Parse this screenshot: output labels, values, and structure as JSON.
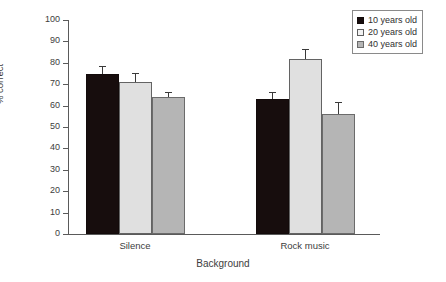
{
  "chart_data": {
    "type": "bar",
    "title": "",
    "subtitle": "",
    "xlabel": "Background",
    "ylabel": "% correct",
    "categories": [
      "Silence",
      "Rock music"
    ],
    "series": [
      {
        "name": "10 years old",
        "values": [
          75,
          63
        ],
        "errors": [
          3,
          3
        ],
        "color": "#170d0d"
      },
      {
        "name": "20 years old",
        "values": [
          71,
          82
        ],
        "errors": [
          4,
          4
        ],
        "color": "#e0e0e0"
      },
      {
        "name": "40 years old",
        "values": [
          64,
          56
        ],
        "errors": [
          2,
          5
        ],
        "color": "#b5b5b5"
      }
    ],
    "ylim": [
      0,
      100
    ],
    "ytick_values": [
      0,
      10,
      20,
      30,
      40,
      50,
      60,
      70,
      80,
      90,
      100
    ],
    "ytick_labels": [
      "0",
      "10",
      "20",
      "30",
      "40",
      "50",
      "60",
      "70",
      "80",
      "90",
      "100"
    ],
    "grid": false,
    "error_bar_direction": "up",
    "legend_position": "top-right",
    "legend_border": true
  },
  "axes": {
    "y_label": "% correct",
    "x_label": "Background",
    "y_ticks": [
      "0",
      "10",
      "20",
      "30",
      "40",
      "50",
      "60",
      "70",
      "80",
      "90",
      "100"
    ],
    "x_categories": [
      "Silence",
      "Rock music"
    ]
  },
  "legend": {
    "entries": [
      {
        "label": "10 years old",
        "style": "s-black"
      },
      {
        "label": "20 years old",
        "style": "s-light"
      },
      {
        "label": "40 years old",
        "style": "s-gray"
      }
    ]
  },
  "colors": {
    "series_1": "#170d0d",
    "series_2": "#e0e0e0",
    "series_3": "#b5b5b5",
    "axis": "#5a5a5a",
    "text": "#3d3d3d",
    "background": "#ffffff"
  }
}
